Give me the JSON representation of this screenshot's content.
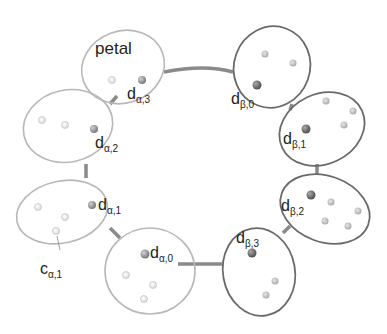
{
  "diagram": {
    "title_label": "petal",
    "colors": {
      "alpha_outline": "#b8b8b8",
      "beta_outline": "#6a6a6a",
      "ring": "#8a8a8a",
      "alpha_d_point": "#8c8c8c",
      "beta_d_point": "#6b6b6b",
      "alpha_c_point": "#ececec",
      "beta_c_point": "#c4c4c4"
    },
    "petals": [
      {
        "id": "a3",
        "group": "alpha",
        "d_base": "d",
        "d_sub": "α,3"
      },
      {
        "id": "a2",
        "group": "alpha",
        "d_base": "d",
        "d_sub": "α,2"
      },
      {
        "id": "a1",
        "group": "alpha",
        "d_base": "d",
        "d_sub": "α,1",
        "c_base": "c",
        "c_sub": "α,1"
      },
      {
        "id": "a0",
        "group": "alpha",
        "d_base": "d",
        "d_sub": "α,0"
      },
      {
        "id": "b0",
        "group": "beta",
        "d_base": "d",
        "d_sub": "β,0"
      },
      {
        "id": "b1",
        "group": "beta",
        "d_base": "d",
        "d_sub": "β,1"
      },
      {
        "id": "b2",
        "group": "beta",
        "d_base": "d",
        "d_sub": "β,2"
      },
      {
        "id": "b3",
        "group": "beta",
        "d_base": "d",
        "d_sub": "β,3"
      }
    ]
  }
}
